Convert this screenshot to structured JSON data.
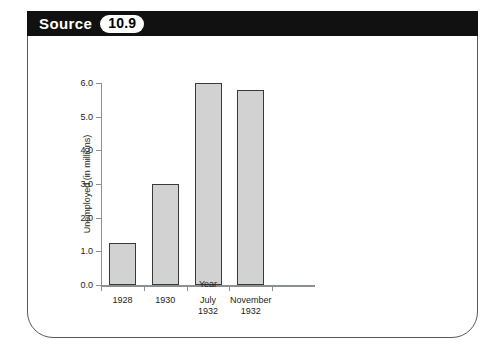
{
  "banner": {
    "label": "Source",
    "number": "10.9"
  },
  "chart_data": {
    "type": "bar",
    "title": "",
    "categories": [
      "1928",
      "1930",
      "July\n1932",
      "November\n1932"
    ],
    "values": [
      1.25,
      3.0,
      6.0,
      5.8
    ],
    "xlabel": "Year",
    "ylabel": "Unemployed (in millions)",
    "ylim": [
      0.0,
      6.0
    ],
    "yticks": [
      "0.0",
      "1.0",
      "2.0",
      "3.0",
      "4.0",
      "5.0",
      "6.0"
    ],
    "ytick_values": [
      0.0,
      1.0,
      2.0,
      3.0,
      4.0,
      5.0,
      6.0
    ],
    "grid": false,
    "legend": null,
    "bar_fill_color": "#d2d2d2",
    "bar_edge_color": "#3a3a3a",
    "axis_color": "#8b8f93"
  }
}
